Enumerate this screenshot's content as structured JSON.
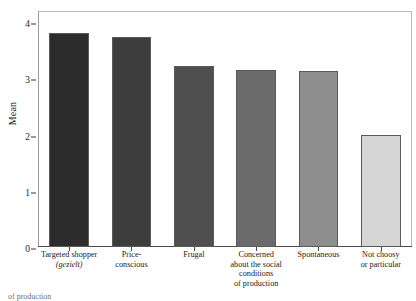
{
  "chart_data": {
    "type": "bar",
    "title": "",
    "xlabel": "",
    "ylabel": "Mean",
    "ylim": [
      0,
      4.2
    ],
    "yticks": [
      0,
      1,
      2,
      3,
      4
    ],
    "ytick_labels": [
      "0",
      "1",
      "2",
      "3",
      "4"
    ],
    "grid": false,
    "legend": "none",
    "categories": [
      "Targeted shopper (gezielt)",
      "Price-conscious",
      "Frugal",
      "Concerned about the social conditions of production",
      "Spontaneous",
      "Not choosy or particular"
    ],
    "category_lines": [
      [
        "Targeted shopper",
        "(gezielt)"
      ],
      [
        "Price-",
        "conscious"
      ],
      [
        "Frugal"
      ],
      [
        "Concerned",
        "about the social",
        "conditions",
        "of production"
      ],
      [
        "Spontaneous"
      ],
      [
        "Not choosy",
        "or particular"
      ]
    ],
    "category_italic_lines": [
      [
        false,
        true
      ],
      [
        false,
        false
      ],
      [
        false
      ],
      [
        false,
        false,
        false,
        false
      ],
      [
        false
      ],
      [
        false,
        false
      ]
    ],
    "values": [
      3.81,
      3.73,
      3.23,
      3.15,
      3.13,
      1.99
    ],
    "bar_colors": [
      "#2c2c2c",
      "#3d3d3d",
      "#4f4f4f",
      "#6b6b6b",
      "#8e8e8e",
      "#d5d5d5"
    ],
    "bar_edge_color": "#5a5a5a"
  },
  "axis": {
    "y_title": "Mean"
  },
  "caption": {
    "text": "of production"
  }
}
